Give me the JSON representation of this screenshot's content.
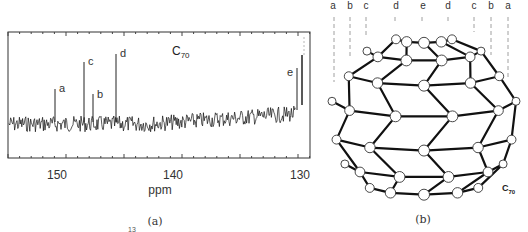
{
  "panel_a": {
    "caption": "(a)",
    "title": "C70",
    "title_main": "C",
    "title_sub": "70",
    "xlabel": "ppm",
    "x_ticks": [
      "150",
      "140",
      "130"
    ],
    "peak_labels": [
      "a",
      "b",
      "c",
      "d",
      "e"
    ]
  },
  "panel_b": {
    "caption": "(b)",
    "molecule_label_main": "C",
    "molecule_label_sub": "70",
    "top_labels": [
      "a",
      "b",
      "c",
      "d",
      "e",
      "d",
      "c",
      "b",
      "a"
    ]
  },
  "footnote_fragment": "13",
  "chart_data": {
    "type": "line",
    "title": "C70",
    "xlabel": "ppm",
    "ylabel": "",
    "xlim": [
      154,
      128.5
    ],
    "x_ticks": [
      150,
      140,
      130
    ],
    "grid": false,
    "series": [
      {
        "name": "13C NMR spectrum of C70",
        "peaks": [
          {
            "label": "a",
            "ppm": 150.0,
            "relative_height": 0.45
          },
          {
            "label": "b",
            "ppm": 146.8,
            "relative_height": 0.38
          },
          {
            "label": "c",
            "ppm": 147.4,
            "relative_height": 0.75
          },
          {
            "label": "d",
            "ppm": 144.8,
            "relative_height": 0.85
          },
          {
            "label": "e",
            "ppm": 130.3,
            "relative_height": 0.65
          }
        ]
      }
    ]
  }
}
